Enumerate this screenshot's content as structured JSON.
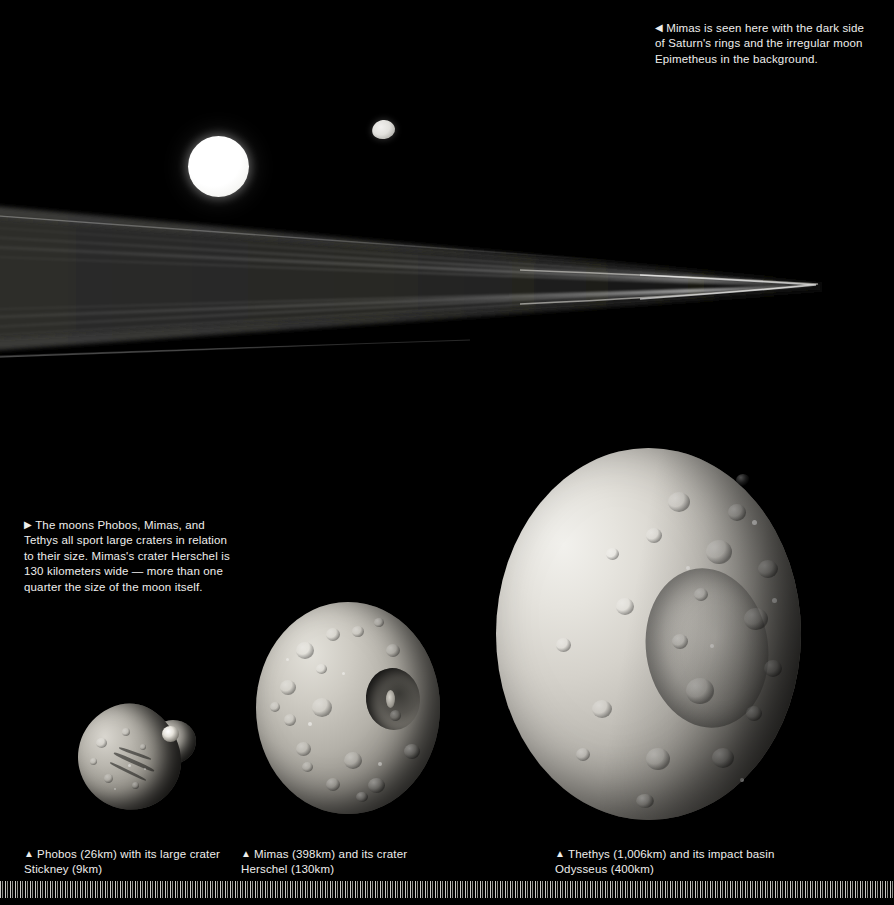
{
  "page": {
    "background_color": "#000000",
    "width": 894,
    "height": 905
  },
  "captions": {
    "top_right": {
      "arrow": "◀",
      "arrow_icon": "triangle-left-icon",
      "text": "Mimas is seen here with the dark side of Saturn's rings and the irregular moon Epimetheus in the background."
    },
    "middle_left": {
      "arrow": "▶",
      "arrow_icon": "triangle-right-icon",
      "text": "The moons Phobos, Mimas, and Tethys all sport large craters in relation to their size. Mimas's crater Herschel is 130 kilometers wide — more than one quarter the size of the moon itself."
    },
    "phobos": {
      "arrow": "▲",
      "arrow_icon": "triangle-up-icon",
      "text": "Phobos (26km) with its large crater Stickney (9km)"
    },
    "mimas": {
      "arrow": "▲",
      "arrow_icon": "triangle-up-icon",
      "text": "Mimas (398km) and its crater Herschel (130km)"
    },
    "tethys": {
      "arrow": "▲",
      "arrow_icon": "triangle-up-icon",
      "text": "Thethys (1,006km) and its impact basin Odysseus (400km)"
    }
  },
  "scene_top": {
    "description": "Mimas lit bright against the dark side of Saturn's rings, with Epimetheus nearby",
    "objects": [
      {
        "name": "mimas-distant",
        "label": "Mimas",
        "shape": "sphere",
        "cx": 218,
        "cy": 166,
        "radius": 30
      },
      {
        "name": "epimetheus",
        "label": "Epimetheus",
        "shape": "irregular",
        "cx": 383,
        "cy": 129,
        "radius": 11
      },
      {
        "name": "saturn-rings",
        "label": "Saturn's rings (dark side)",
        "shape": "ring-wedge",
        "converge_x": 822,
        "converge_y": 286
      }
    ]
  },
  "moon_row": {
    "items": [
      {
        "name": "phobos",
        "label": "Phobos",
        "diameter_km": 26,
        "feature": "Stickney",
        "feature_km": 9
      },
      {
        "name": "mimas",
        "label": "Mimas",
        "diameter_km": 398,
        "feature": "Herschel",
        "feature_km": 130
      },
      {
        "name": "tethys",
        "label": "Thethys",
        "diameter_km": 1006,
        "feature": "Odysseus",
        "feature_km": 400
      }
    ]
  },
  "footer": {
    "barcode": "fine vertical tick strip"
  },
  "colors": {
    "background": "#000000",
    "caption_text": "#efeeec",
    "moon_highlight": "#f2f1ed",
    "moon_shadow": "#1d1d1b"
  }
}
